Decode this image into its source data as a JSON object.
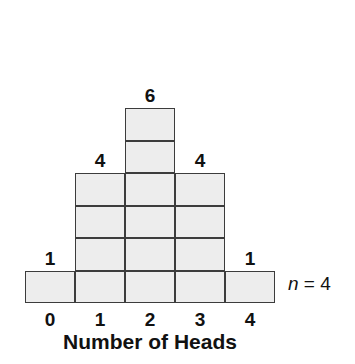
{
  "chart_data": {
    "type": "bar",
    "title": "",
    "xlabel": "Number of Heads",
    "ylabel": "",
    "categories": [
      "0",
      "1",
      "2",
      "3",
      "4"
    ],
    "values": [
      1,
      4,
      6,
      4,
      1
    ],
    "value_labels": [
      "1",
      "4",
      "6",
      "4",
      "1"
    ],
    "annotation": "n = 4",
    "annotation_variable": "n",
    "annotation_rest": " = 4",
    "ylim": [
      0,
      6
    ],
    "grid": false,
    "legend": "none",
    "style": "stacked unit squares",
    "fill_color": "#ededed",
    "stroke_color": "#3c3c3c",
    "text_color": "#111111"
  },
  "geometry": {
    "cell_width": 50,
    "cell_height": 32.5,
    "left": 25,
    "baseline_bottom": 303
  }
}
